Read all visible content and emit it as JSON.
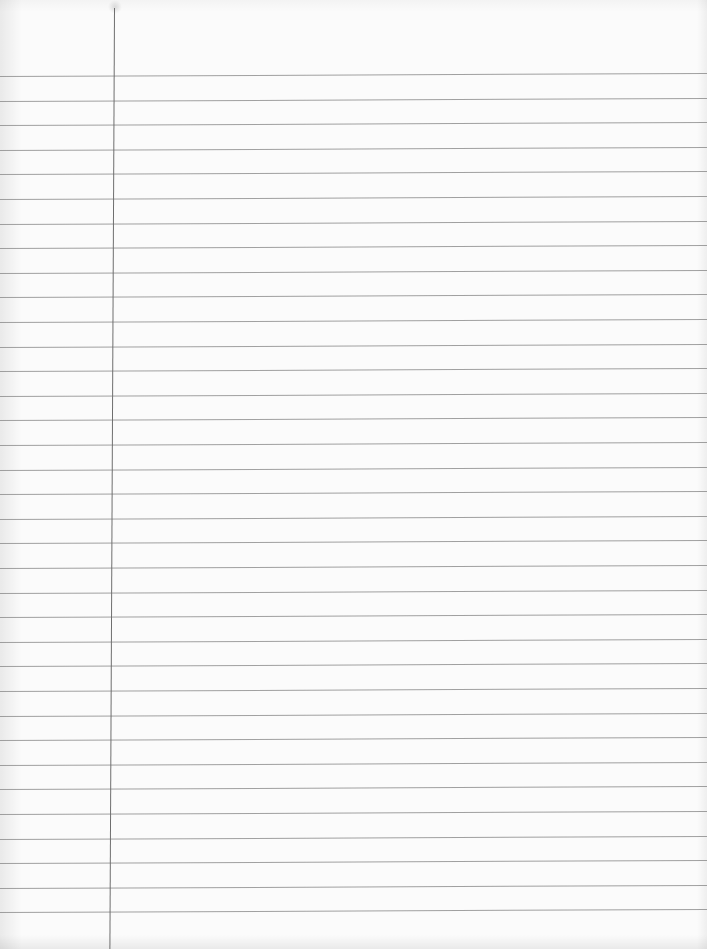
{
  "page": {
    "type": "lined-notebook-paper",
    "content_text": "",
    "paper_color": "#fbfbfb",
    "rule_color": "#8f8f8f",
    "margin_line_color": "#6e6e6e",
    "rule_count": 35,
    "first_rule_y": 76,
    "rule_spacing_px": 24.6,
    "margin_line_x": 114
  }
}
